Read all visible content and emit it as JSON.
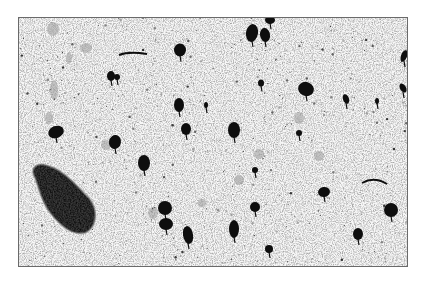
{
  "image": {
    "kind": "histology micrograph",
    "description": "Grayscale stained brain tissue section showing darkly stained neurons scattered over a pale speckled neuropil, with a large granular blood vessel at lower left",
    "colors": {
      "background": "#ffffff",
      "tissue": "#f6f6f6",
      "stained_cell": "#0e0e0e",
      "faint_cell": "#9a9a9a",
      "border": "#6a6a6a"
    }
  }
}
